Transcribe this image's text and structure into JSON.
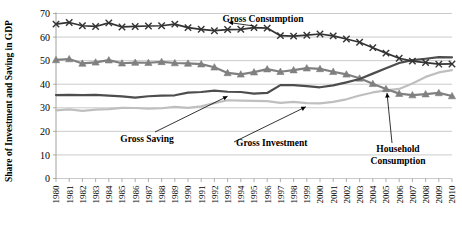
{
  "chart_data": {
    "type": "line",
    "title": "",
    "xlabel": "",
    "ylabel": "Share of Investment and Saving in GDP",
    "ylim": [
      0,
      70
    ],
    "ytick_labels": [
      "0",
      "10",
      "20",
      "30",
      "40",
      "50",
      "60",
      "70"
    ],
    "yticks": [
      0,
      10,
      20,
      30,
      40,
      50,
      60,
      70
    ],
    "grid": true,
    "legend_position": "inline-annotations",
    "x": [
      1980,
      1981,
      1982,
      1983,
      1984,
      1985,
      1986,
      1987,
      1988,
      1989,
      1990,
      1991,
      1992,
      1993,
      1994,
      1995,
      1996,
      1997,
      1998,
      1999,
      2000,
      2001,
      2002,
      2003,
      2004,
      2005,
      2006,
      2007,
      2008,
      2009,
      2010
    ],
    "categories": [
      "1980",
      "1981",
      "1982",
      "1983",
      "1984",
      "1985",
      "1986",
      "1987",
      "1988",
      "1989",
      "1990",
      "1991",
      "1992",
      "1993",
      "1994",
      "1995",
      "1996",
      "1997",
      "1998",
      "1999",
      "2000",
      "2001",
      "2002",
      "2003",
      "2004",
      "2005",
      "2006",
      "2007",
      "2008",
      "2009",
      "2010"
    ],
    "series": [
      {
        "name": "Gross Consumption",
        "color": "#333333",
        "marker": "x",
        "values": [
          65.5,
          66.2,
          64.8,
          64.5,
          66.0,
          64.3,
          64.5,
          64.7,
          64.8,
          65.5,
          64.0,
          63.3,
          62.7,
          63.2,
          63.3,
          64.0,
          63.8,
          60.6,
          60.4,
          60.8,
          61.3,
          60.5,
          59.2,
          57.8,
          55.5,
          53.2,
          51.0,
          49.8,
          49.2,
          48.5,
          48.6
        ]
      },
      {
        "name": "Household Consumption",
        "color": "#808080",
        "marker": "triangle",
        "values": [
          50.3,
          50.7,
          48.8,
          49.3,
          50.2,
          48.9,
          49.2,
          49.1,
          49.5,
          49.0,
          48.8,
          48.5,
          47.2,
          44.8,
          44.2,
          45.1,
          46.4,
          45.3,
          46.0,
          46.8,
          46.5,
          45.3,
          44.2,
          42.5,
          40.2,
          38.0,
          36.0,
          35.4,
          35.8,
          36.3,
          35.0
        ]
      },
      {
        "name": "Gross Saving",
        "color": "#4d4d4d",
        "marker": "none",
        "values": [
          35.4,
          35.5,
          35.4,
          35.5,
          35.2,
          34.8,
          34.3,
          34.9,
          35.2,
          35.3,
          36.4,
          36.7,
          37.3,
          36.8,
          36.7,
          36.0,
          36.3,
          39.6,
          39.6,
          39.2,
          38.7,
          39.5,
          40.8,
          42.2,
          44.5,
          46.8,
          49.0,
          50.2,
          50.8,
          51.5,
          51.4
        ]
      },
      {
        "name": "Gross Investment",
        "color": "#bfbfbf",
        "marker": "none",
        "values": [
          28.9,
          29.3,
          28.7,
          29.2,
          29.4,
          30.0,
          29.9,
          29.6,
          29.8,
          30.4,
          30.0,
          30.6,
          32.0,
          33.2,
          33.0,
          32.9,
          32.8,
          32.1,
          32.5,
          32.0,
          31.9,
          32.5,
          33.6,
          35.2,
          36.5,
          37.4,
          38.0,
          40.3,
          43.1,
          45.0,
          46.0
        ]
      }
    ],
    "annotations": [
      {
        "text": "Gross Consumption",
        "target_x": 1993,
        "target_y": 64.5
      },
      {
        "text": "Gross Saving",
        "target_x": 1993,
        "target_y": 36.6
      },
      {
        "text": "Gross Investment",
        "target_x": 1999,
        "target_y": 32.1
      },
      {
        "text": "Household Consumption",
        "line1": "Household",
        "line2": "Consumption",
        "target_x": 2005,
        "target_y": 38.4
      }
    ]
  }
}
